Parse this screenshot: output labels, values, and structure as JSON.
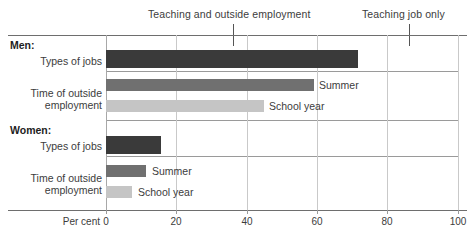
{
  "chart_data": {
    "type": "bar",
    "orientation": "horizontal",
    "title": "",
    "xlabel": "Per cent",
    "ylabel": "",
    "xlim": [
      0,
      100
    ],
    "xticks": [
      0,
      20,
      40,
      60,
      80,
      100
    ],
    "xticklabels": [
      "0",
      "20",
      "40",
      "60",
      "80",
      "100"
    ],
    "grid": true,
    "legend_position": "inline-labels",
    "groups": [
      {
        "name": "Men:",
        "rows": [
          {
            "label": "Types of jobs",
            "label_line2": "",
            "bars": [
              {
                "series": "Types of jobs",
                "value": 71.5,
                "color": "#3a3a3a",
                "inline_label": ""
              }
            ]
          },
          {
            "label": "Time of outside",
            "label_line2": "employment",
            "bars": [
              {
                "series": "Summer",
                "value": 59.0,
                "color": "#707070",
                "inline_label": "Summer"
              },
              {
                "series": "School year",
                "value": 45.0,
                "color": "#c5c5c5",
                "inline_label": "School year"
              }
            ]
          }
        ]
      },
      {
        "name": "Women:",
        "rows": [
          {
            "label": "Types of jobs",
            "label_line2": "",
            "bars": [
              {
                "series": "Types of jobs",
                "value": 15.5,
                "color": "#3a3a3a",
                "inline_label": ""
              }
            ]
          },
          {
            "label": "Time of outside",
            "label_line2": "employment",
            "bars": [
              {
                "series": "Summer",
                "value": 11.5,
                "color": "#707070",
                "inline_label": "Summer"
              },
              {
                "series": "School year",
                "value": 7.5,
                "color": "#c5c5c5",
                "inline_label": "School year"
              }
            ]
          }
        ]
      }
    ],
    "annotations": [
      {
        "text": "Teaching and outside employment",
        "value": 36
      },
      {
        "text": "Teaching job only",
        "value": 86
      }
    ]
  },
  "labels": {
    "annotation_1": "Teaching and outside employment",
    "annotation_2": "Teaching job only",
    "group_men": "Men:",
    "group_women": "Women:",
    "men_types_of_jobs": "Types of jobs",
    "men_time_line1": "Time of outside",
    "men_time_line2": "employment",
    "women_types_of_jobs": "Types of jobs",
    "women_time_line1": "Time of outside",
    "women_time_line2": "employment",
    "men_summer": "Summer",
    "men_school_year": "School year",
    "women_summer": "Summer",
    "women_school_year": "School year",
    "axis_title": "Per cent",
    "tick_0": "0",
    "tick_20": "20",
    "tick_40": "40",
    "tick_60": "60",
    "tick_80": "80",
    "tick_100": "100"
  },
  "colors": {
    "dark_bar": "#3a3a3a",
    "summer_bar": "#707070",
    "school_year_bar": "#c5c5c5",
    "gridline": "#c9c9c9",
    "frame": "#6e6e6e"
  }
}
